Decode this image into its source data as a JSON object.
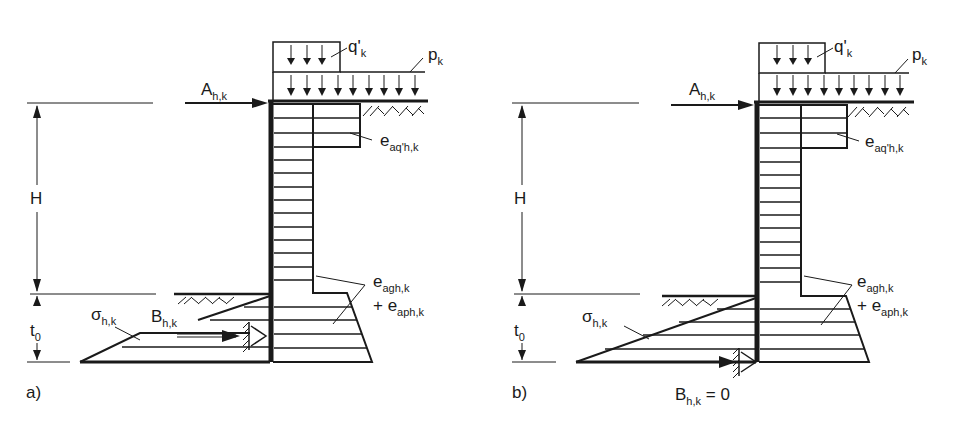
{
  "diagram": {
    "type": "retaining-wall-earth-pressure",
    "panels": [
      {
        "id": "a",
        "caption": "a)",
        "labels": {
          "surcharge_local": {
            "base": "q'",
            "sub": "k"
          },
          "surcharge_uniform": {
            "base": "p",
            "sub": "k"
          },
          "anchor_force": {
            "base": "A",
            "sub": "h,k"
          },
          "pressure_surcharge": {
            "base": "e",
            "sub": "aq'h,k"
          },
          "height": "H",
          "embedment": {
            "base": "t",
            "sub": "0"
          },
          "pressure_earth": {
            "base": "e",
            "sub": "agh,k"
          },
          "pressure_earth_plus": {
            "base": "+ e",
            "sub": "aph,k"
          },
          "passive_stress": {
            "base": "σ",
            "sub": "h,k"
          },
          "support_force": {
            "base": "B",
            "sub": "h,k"
          }
        }
      },
      {
        "id": "b",
        "caption": "b)",
        "labels": {
          "surcharge_local": {
            "base": "q'",
            "sub": "k"
          },
          "surcharge_uniform": {
            "base": "p",
            "sub": "k"
          },
          "anchor_force": {
            "base": "A",
            "sub": "h,k"
          },
          "pressure_surcharge": {
            "base": "e",
            "sub": "aq'h,k"
          },
          "height": "H",
          "embedment": {
            "base": "t",
            "sub": "0"
          },
          "pressure_earth": {
            "base": "e",
            "sub": "agh,k"
          },
          "pressure_earth_plus": {
            "base": "+ e",
            "sub": "aph,k"
          },
          "passive_stress": {
            "base": "σ",
            "sub": "h,k"
          },
          "support_force": {
            "base": "B",
            "sub": "h,k",
            "suffix": " = 0"
          }
        }
      }
    ],
    "colors": {
      "ink": "#1a1a1a",
      "background": "#ffffff"
    }
  }
}
